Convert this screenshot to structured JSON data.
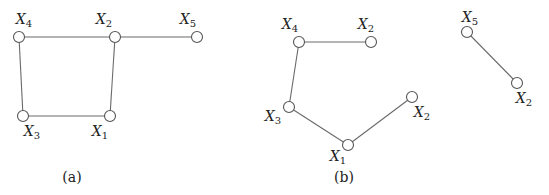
{
  "figure": {
    "panels": [
      {
        "id": "a",
        "caption": "(a)",
        "nodes": [
          {
            "id": "a-x4",
            "base": "X",
            "sub": "4"
          },
          {
            "id": "a-x2",
            "base": "X",
            "sub": "2"
          },
          {
            "id": "a-x5",
            "base": "X",
            "sub": "5"
          },
          {
            "id": "a-x3",
            "base": "X",
            "sub": "3"
          },
          {
            "id": "a-x1",
            "base": "X",
            "sub": "1"
          }
        ],
        "edges": [
          [
            "a-x4",
            "a-x2"
          ],
          [
            "a-x2",
            "a-x5"
          ],
          [
            "a-x4",
            "a-x3"
          ],
          [
            "a-x3",
            "a-x1"
          ],
          [
            "a-x1",
            "a-x2"
          ]
        ]
      },
      {
        "id": "b",
        "caption": "(b)",
        "nodes": [
          {
            "id": "b-x4",
            "base": "X",
            "sub": "4"
          },
          {
            "id": "b-x2a",
            "base": "X",
            "sub": "2"
          },
          {
            "id": "b-x3",
            "base": "X",
            "sub": "3"
          },
          {
            "id": "b-x1",
            "base": "X",
            "sub": "1"
          },
          {
            "id": "b-x2b",
            "base": "X",
            "sub": "2"
          },
          {
            "id": "b-x5",
            "base": "X",
            "sub": "5"
          },
          {
            "id": "b-x2c",
            "base": "X",
            "sub": "2"
          }
        ],
        "edges": [
          [
            "b-x4",
            "b-x2a"
          ],
          [
            "b-x4",
            "b-x3"
          ],
          [
            "b-x3",
            "b-x1"
          ],
          [
            "b-x1",
            "b-x2b"
          ],
          [
            "b-x5",
            "b-x2c"
          ]
        ]
      }
    ]
  }
}
